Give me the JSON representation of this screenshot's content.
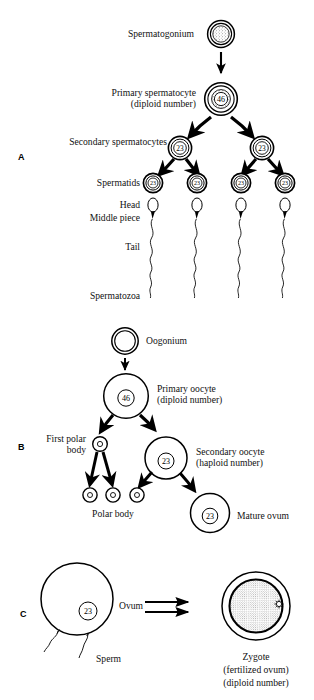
{
  "figure": {
    "title_implicit": "Gametogenesis and fertilization",
    "panels": [
      {
        "id": "A",
        "label": "A",
        "name": "spermatogenesis",
        "labels": {
          "spermatogonium": "Spermatogonium",
          "primary_spermatocyte": "Primary spermatocyte",
          "primary_spermatocyte_sub": "(diploid number)",
          "secondary_spermatocytes": "Secondary spermatocytes",
          "spermatids": "Spermatids",
          "head": "Head",
          "middle_piece": "Middle piece",
          "tail": "Tail",
          "spermatozoa": "Spermatozoa"
        },
        "chromosome_numbers": {
          "primary_spermatocyte": "46",
          "secondary_spermatocyte_left": "23",
          "secondary_spermatocyte_right": "23",
          "spermatid_1": "23",
          "spermatid_2": "23",
          "spermatid_3": "23",
          "spermatid_4": "23"
        }
      },
      {
        "id": "B",
        "label": "B",
        "name": "oogenesis",
        "labels": {
          "oogonium": "Oogonium",
          "primary_oocyte": "Primary oocyte",
          "primary_oocyte_sub": "(diploid number)",
          "first_polar_body_l1": "First polar",
          "first_polar_body_l2": "body",
          "secondary_oocyte": "Secondary oocyte",
          "secondary_oocyte_sub": "(haploid number)",
          "polar_body": "Polar body",
          "mature_ovum": "Mature ovum"
        },
        "chromosome_numbers": {
          "primary_oocyte": "46",
          "secondary_oocyte": "23",
          "mature_ovum": "23"
        }
      },
      {
        "id": "C",
        "label": "C",
        "name": "fertilization",
        "labels": {
          "ovum": "Ovum",
          "sperm": "Sperm",
          "zygote": "Zygote",
          "zygote_sub1": "(fertilized ovum)",
          "zygote_sub2": "(diploid number)"
        },
        "chromosome_numbers": {
          "ovum": "23"
        }
      }
    ],
    "colors": {
      "ink": "#000000",
      "background": "#ffffff",
      "stipple": "#555555"
    }
  }
}
